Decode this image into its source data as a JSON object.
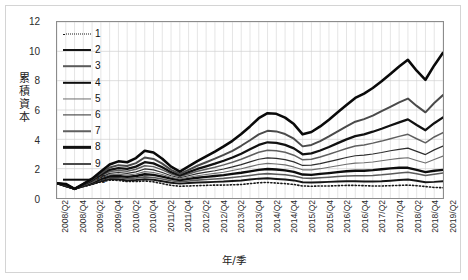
{
  "chart_data": {
    "type": "line",
    "title": "",
    "xlabel": "年/季",
    "ylabel": "累積資本",
    "ylim": [
      0,
      12
    ],
    "yticks": [
      0,
      2,
      4,
      6,
      8,
      10,
      12
    ],
    "grid": true,
    "legend_position": "inside-top-left",
    "x": [
      "2008/Q2",
      "2008/Q3",
      "2008/Q4",
      "2009/Q1",
      "2009/Q2",
      "2009/Q3",
      "2009/Q4",
      "2010/Q1",
      "2010/Q2",
      "2010/Q3",
      "2010/Q4",
      "2011/Q1",
      "2011/Q2",
      "2011/Q3",
      "2011/Q4",
      "2012/Q1",
      "2012/Q2",
      "2012/Q3",
      "2012/Q4",
      "2013/Q1",
      "2013/Q2",
      "2013/Q3",
      "2013/Q4",
      "2014/Q1",
      "2014/Q2",
      "2014/Q3",
      "2014/Q4",
      "2015/Q1",
      "2015/Q2",
      "2015/Q3",
      "2015/Q4",
      "2016/Q1",
      "2016/Q2",
      "2016/Q3",
      "2016/Q4",
      "2017/Q1",
      "2017/Q2",
      "2017/Q3",
      "2017/Q4",
      "2018/Q1",
      "2018/Q2",
      "2018/Q3",
      "2018/Q4",
      "2019/Q1",
      "2019/Q2"
    ],
    "xtick_labels": [
      "2008/Q2",
      "2008/Q4",
      "2009/Q2",
      "2009/Q4",
      "2010/Q2",
      "2010/Q4",
      "2011/Q2",
      "2011/Q4",
      "2012/Q2",
      "2012/Q4",
      "2013/Q2",
      "2013/Q4",
      "2014/Q2",
      "2014/Q4",
      "2015/Q2",
      "2015/Q4",
      "2016/Q2",
      "2016/Q4",
      "2017/Q2",
      "2017/Q4",
      "2018/Q2",
      "2018/Q4",
      "2019/Q2"
    ],
    "xtick_indices": [
      0,
      2,
      4,
      6,
      8,
      10,
      12,
      14,
      16,
      18,
      20,
      22,
      24,
      26,
      28,
      30,
      32,
      34,
      36,
      38,
      40,
      42,
      44
    ],
    "series": [
      {
        "name": "1",
        "style": "dotted",
        "width": 1.6,
        "color": "#1a1a1a",
        "values": [
          1.0,
          0.78,
          0.62,
          0.78,
          0.92,
          1.1,
          1.22,
          1.2,
          1.12,
          1.12,
          1.16,
          1.1,
          0.98,
          0.86,
          0.8,
          0.82,
          0.84,
          0.86,
          0.88,
          0.88,
          0.9,
          0.92,
          0.98,
          1.04,
          1.06,
          1.02,
          0.98,
          0.92,
          0.82,
          0.8,
          0.82,
          0.82,
          0.84,
          0.86,
          0.86,
          0.84,
          0.82,
          0.82,
          0.84,
          0.86,
          0.88,
          0.84,
          0.78,
          0.72,
          0.7
        ]
      },
      {
        "name": "2",
        "style": "solid",
        "width": 2.0,
        "color": "#151515",
        "values": [
          1.0,
          0.8,
          0.62,
          0.8,
          0.96,
          1.16,
          1.3,
          1.28,
          1.2,
          1.22,
          1.28,
          1.24,
          1.14,
          1.04,
          0.98,
          1.02,
          1.06,
          1.08,
          1.1,
          1.12,
          1.16,
          1.2,
          1.26,
          1.32,
          1.34,
          1.3,
          1.26,
          1.2,
          1.08,
          1.06,
          1.08,
          1.1,
          1.12,
          1.14,
          1.14,
          1.12,
          1.12,
          1.14,
          1.18,
          1.22,
          1.26,
          1.18,
          1.08,
          1.1,
          1.14
        ]
      },
      {
        "name": "3",
        "style": "solid",
        "width": 1.6,
        "color": "#5a5a5a",
        "values": [
          1.0,
          0.82,
          0.62,
          0.82,
          1.0,
          1.22,
          1.38,
          1.38,
          1.32,
          1.36,
          1.44,
          1.4,
          1.3,
          1.18,
          1.1,
          1.16,
          1.22,
          1.26,
          1.3,
          1.34,
          1.4,
          1.46,
          1.54,
          1.62,
          1.66,
          1.62,
          1.58,
          1.5,
          1.36,
          1.34,
          1.38,
          1.42,
          1.46,
          1.5,
          1.52,
          1.52,
          1.54,
          1.58,
          1.64,
          1.7,
          1.76,
          1.66,
          1.54,
          1.62,
          1.7
        ]
      },
      {
        "name": "4",
        "style": "solid",
        "width": 2.4,
        "color": "#0d0d0d",
        "values": [
          1.0,
          0.84,
          0.62,
          0.84,
          1.04,
          1.3,
          1.48,
          1.5,
          1.44,
          1.5,
          1.62,
          1.58,
          1.46,
          1.32,
          1.22,
          1.3,
          1.38,
          1.44,
          1.5,
          1.56,
          1.64,
          1.72,
          1.82,
          1.92,
          1.98,
          1.94,
          1.88,
          1.78,
          1.6,
          1.58,
          1.64,
          1.7,
          1.76,
          1.82,
          1.86,
          1.86,
          1.9,
          1.96,
          2.02,
          2.06,
          2.06,
          1.92,
          1.76,
          1.86,
          1.92
        ]
      },
      {
        "name": "5",
        "style": "solid",
        "width": 1.1,
        "color": "#6e6e6e",
        "values": [
          1.0,
          0.86,
          0.62,
          0.86,
          1.08,
          1.36,
          1.58,
          1.62,
          1.56,
          1.64,
          1.8,
          1.74,
          1.6,
          1.42,
          1.3,
          1.42,
          1.52,
          1.6,
          1.68,
          1.76,
          1.88,
          2.0,
          2.14,
          2.28,
          2.36,
          2.32,
          2.26,
          2.12,
          1.92,
          1.92,
          2.0,
          2.1,
          2.2,
          2.3,
          2.38,
          2.4,
          2.46,
          2.54,
          2.62,
          2.7,
          2.74,
          2.56,
          2.38,
          2.62,
          2.86
        ]
      },
      {
        "name": "6",
        "style": "solid",
        "width": 1.2,
        "color": "#2e2e2e",
        "values": [
          1.0,
          0.88,
          0.62,
          0.88,
          1.12,
          1.42,
          1.68,
          1.74,
          1.68,
          1.78,
          1.98,
          1.92,
          1.74,
          1.52,
          1.38,
          1.52,
          1.66,
          1.76,
          1.86,
          1.98,
          2.12,
          2.28,
          2.46,
          2.64,
          2.74,
          2.7,
          2.62,
          2.46,
          2.22,
          2.24,
          2.34,
          2.48,
          2.62,
          2.76,
          2.88,
          2.92,
          3.0,
          3.1,
          3.22,
          3.32,
          3.4,
          3.18,
          2.96,
          3.28,
          3.54
        ]
      },
      {
        "name": "7",
        "style": "solid",
        "width": 1.5,
        "color": "#5f5f5f",
        "values": [
          1.0,
          0.9,
          0.62,
          0.9,
          1.16,
          1.5,
          1.8,
          1.88,
          1.82,
          1.96,
          2.2,
          2.14,
          1.92,
          1.64,
          1.46,
          1.64,
          1.82,
          1.96,
          2.1,
          2.26,
          2.44,
          2.64,
          2.88,
          3.12,
          3.26,
          3.22,
          3.12,
          2.92,
          2.6,
          2.64,
          2.8,
          2.98,
          3.18,
          3.38,
          3.54,
          3.62,
          3.74,
          3.88,
          4.04,
          4.2,
          4.34,
          4.04,
          3.76,
          4.16,
          4.46
        ]
      },
      {
        "name": "8",
        "style": "solid",
        "width": 2.3,
        "color": "#111111",
        "values": [
          1.0,
          0.92,
          0.62,
          0.92,
          1.2,
          1.58,
          1.92,
          2.04,
          1.98,
          2.14,
          2.44,
          2.36,
          2.1,
          1.76,
          1.54,
          1.76,
          1.98,
          2.16,
          2.34,
          2.54,
          2.76,
          3.02,
          3.32,
          3.62,
          3.8,
          3.76,
          3.62,
          3.38,
          2.98,
          3.04,
          3.24,
          3.48,
          3.74,
          4.0,
          4.22,
          4.34,
          4.52,
          4.72,
          4.94,
          5.16,
          5.36,
          4.98,
          4.62,
          5.1,
          5.5
        ]
      },
      {
        "name": "9",
        "style": "solid",
        "width": 2.0,
        "color": "#4a4a4a",
        "values": [
          1.0,
          0.94,
          0.62,
          0.94,
          1.26,
          1.68,
          2.08,
          2.24,
          2.18,
          2.38,
          2.76,
          2.66,
          2.34,
          1.92,
          1.64,
          1.92,
          2.2,
          2.44,
          2.68,
          2.94,
          3.22,
          3.56,
          3.94,
          4.34,
          4.58,
          4.54,
          4.36,
          4.04,
          3.52,
          3.62,
          3.88,
          4.2,
          4.54,
          4.88,
          5.2,
          5.38,
          5.62,
          5.92,
          6.22,
          6.52,
          6.78,
          6.28,
          5.84,
          6.48,
          7.02
        ]
      },
      {
        "name": "10",
        "style": "solid",
        "width": 2.6,
        "color": "#0a0a0a",
        "values": [
          1.0,
          0.96,
          0.62,
          0.96,
          1.32,
          1.8,
          2.28,
          2.5,
          2.44,
          2.72,
          3.22,
          3.1,
          2.68,
          2.14,
          1.8,
          2.16,
          2.52,
          2.84,
          3.16,
          3.52,
          3.9,
          4.36,
          4.88,
          5.44,
          5.78,
          5.74,
          5.48,
          5.04,
          4.34,
          4.5,
          4.88,
          5.34,
          5.84,
          6.34,
          6.82,
          7.12,
          7.5,
          7.96,
          8.46,
          8.96,
          9.42,
          8.68,
          8.06,
          9.04,
          9.9
        ]
      }
    ]
  }
}
